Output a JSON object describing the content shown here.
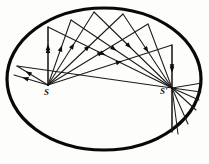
{
  "figure": {
    "type": "geometric-optics-diagram",
    "canvas": {
      "width": 209,
      "height": 164,
      "background": "#fdfdfc"
    },
    "colors": {
      "ink": "#0d0d0d",
      "ellipse_stroke": "#080808",
      "ray_stroke": "#1a1a1a",
      "background": "#fdfdfc"
    },
    "ellipse": {
      "name": "elliptical-mirror-boundary",
      "cx": 104,
      "cy": 79,
      "rx": 97,
      "ry": 71,
      "stroke_width": 3.2
    },
    "foci": [
      {
        "id": "S",
        "label": "S",
        "x": 48,
        "y": 85
      },
      {
        "id": "Sp",
        "label": "S'",
        "x": 172,
        "y": 88
      }
    ],
    "incident_rays": [
      {
        "name": "ray-s-to-p1",
        "x1": 48,
        "y1": 85,
        "x2": 17,
        "y2": 66,
        "arrow_t": 0.55
      },
      {
        "name": "ray-s-to-p2",
        "x1": 48,
        "y1": 85,
        "x2": 14,
        "y2": 75,
        "arrow_t": 0.58
      },
      {
        "name": "ray-s-to-p3",
        "x1": 48,
        "y1": 85,
        "x2": 48,
        "y2": 27,
        "arrow_t": 0.6
      },
      {
        "name": "ray-s-to-p4",
        "x1": 48,
        "y1": 85,
        "x2": 71,
        "y2": 20,
        "arrow_t": 0.52
      },
      {
        "name": "ray-s-to-p5",
        "x1": 48,
        "y1": 85,
        "x2": 94,
        "y2": 12,
        "arrow_t": 0.5
      },
      {
        "name": "ray-s-to-p6",
        "x1": 48,
        "y1": 85,
        "x2": 123,
        "y2": 14,
        "arrow_t": 0.5
      },
      {
        "name": "ray-s-to-p7",
        "x1": 48,
        "y1": 85,
        "x2": 148,
        "y2": 24,
        "arrow_t": 0.5
      },
      {
        "name": "ray-s-to-p8",
        "x1": 48,
        "y1": 85,
        "x2": 172,
        "y2": 45,
        "arrow_t": 0.55
      }
    ],
    "reflected_rays": [
      {
        "name": "ray-p1-to-sp",
        "x1": 17,
        "y1": 66,
        "x2": 172,
        "y2": 88,
        "arrow_t": 0.0
      },
      {
        "name": "ray-p3-to-sp",
        "x1": 48,
        "y1": 27,
        "x2": 172,
        "y2": 88,
        "arrow_t": 0.42
      },
      {
        "name": "ray-p4-to-sp",
        "x1": 71,
        "y1": 20,
        "x2": 172,
        "y2": 88,
        "arrow_t": 0.4
      },
      {
        "name": "ray-p5-to-sp",
        "x1": 94,
        "y1": 12,
        "x2": 172,
        "y2": 88,
        "arrow_t": 0.42
      },
      {
        "name": "ray-p6-to-sp",
        "x1": 123,
        "y1": 14,
        "x2": 172,
        "y2": 88,
        "arrow_t": 0.45
      },
      {
        "name": "ray-p7-to-sp",
        "x1": 148,
        "y1": 24,
        "x2": 172,
        "y2": 88,
        "arrow_t": 0.0
      },
      {
        "name": "ray-p8-to-sp",
        "x1": 172,
        "y1": 45,
        "x2": 172,
        "y2": 88,
        "arrow_t": 0.5
      }
    ],
    "outgoing_rays": [
      {
        "name": "ray-sp-down-1",
        "x1": 172,
        "y1": 88,
        "x2": 201,
        "y2": 92
      },
      {
        "name": "ray-sp-down-2",
        "x1": 172,
        "y1": 88,
        "x2": 199,
        "y2": 100
      },
      {
        "name": "ray-sp-down-3",
        "x1": 172,
        "y1": 88,
        "x2": 196,
        "y2": 110
      },
      {
        "name": "ray-sp-down-4",
        "x1": 172,
        "y1": 88,
        "x2": 188,
        "y2": 124
      },
      {
        "name": "ray-sp-down-5",
        "x1": 172,
        "y1": 88,
        "x2": 178,
        "y2": 134
      },
      {
        "name": "ray-sp-down-6",
        "x1": 172,
        "y1": 88,
        "x2": 172,
        "y2": 132
      },
      {
        "name": "ray-sp-up-right",
        "x1": 172,
        "y1": 88,
        "x2": 202,
        "y2": 83
      }
    ],
    "vertical_axes": [
      {
        "name": "vertical-through-s",
        "x1": 48,
        "y1": 85,
        "x2": 48,
        "y2": 27
      },
      {
        "name": "vertical-through-sp",
        "x1": 172,
        "y1": 45,
        "x2": 172,
        "y2": 132
      }
    ]
  }
}
